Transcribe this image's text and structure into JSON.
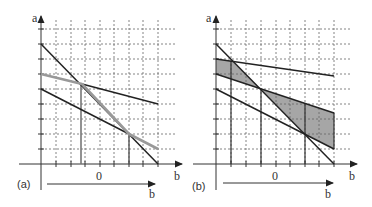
{
  "figure": {
    "panels": [
      {
        "id": "a",
        "label": "(a)",
        "y_axis_label": "a",
        "x_axis_label": "b",
        "zero_label": "0",
        "lower_arrow_label": "b"
      },
      {
        "id": "b",
        "label": "(b)",
        "y_axis_label": "a",
        "x_axis_label": "b",
        "zero_label": "0",
        "lower_arrow_label": "b"
      }
    ],
    "colors": {
      "line": "#222222",
      "highlight_line": "#999999",
      "shade": "#a6a6a6",
      "grid": "#555555",
      "axis": "#333333"
    }
  }
}
